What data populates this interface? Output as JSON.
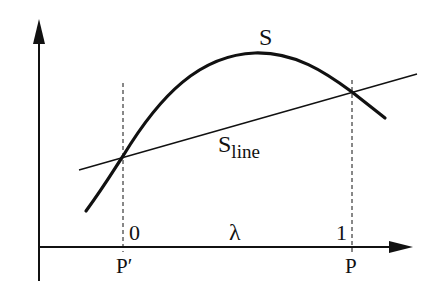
{
  "diagram": {
    "colors": {
      "ink": "#111111",
      "background": "#ffffff"
    },
    "axes": {
      "x_axis_label": "λ",
      "x_tick_start": "0",
      "x_tick_end": "1",
      "point_start_label": "P′",
      "point_end_label": "P"
    },
    "curves": {
      "curve_label": "S",
      "line_label_main": "S",
      "line_label_sub": "line"
    }
  }
}
